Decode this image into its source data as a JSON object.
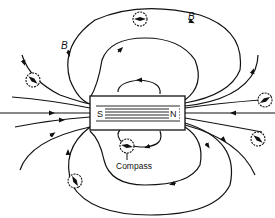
{
  "diagram": {
    "magnet": {
      "south_label": "S",
      "north_label": "N"
    },
    "field_labels": [
      "B",
      "B"
    ],
    "compass_label": "Compass",
    "colors": {
      "ink": "#111111",
      "background": "#ffffff"
    }
  }
}
